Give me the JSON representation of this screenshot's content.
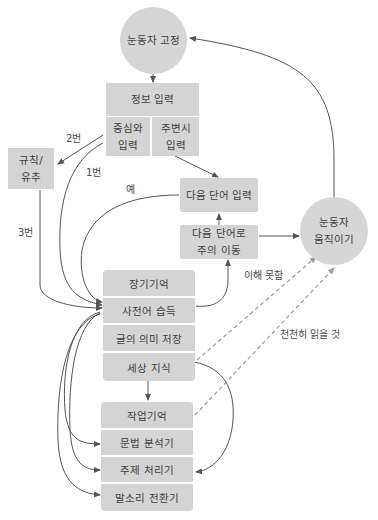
{
  "diagram": {
    "type": "reading-process-flowchart",
    "nodes": {
      "fixation": {
        "label": "눈동자 고정",
        "shape": "circle"
      },
      "info_input": {
        "label": "정보 입력",
        "sub": {
          "foveal": "중심와\n입력",
          "foveal_l1": "중심와",
          "foveal_l2": "입력",
          "peripheral_l1": "주변시",
          "peripheral_l2": "입력"
        }
      },
      "rule_inference": {
        "l1": "규칙/",
        "l2": "유추"
      },
      "next_word_input": {
        "label": "다음 단어 입력"
      },
      "shift_attention": {
        "l1": "다음 단어로",
        "l2": "주의 이동"
      },
      "eye_movement": {
        "l1": "눈동자",
        "l2": "움직이기",
        "shape": "circle"
      },
      "long_term_memory": {
        "rows": [
          "장기기억",
          "사전어 습득",
          "글의 의미 저장",
          "세상 지식"
        ]
      },
      "working_memory": {
        "rows": [
          "작업기억",
          "문법 분석기",
          "주제 처리기",
          "말소리 전환기"
        ]
      }
    },
    "edge_labels": {
      "path2": "2번",
      "path1": "1번",
      "path3": "3번",
      "yes": "예",
      "not_understood": "이해 못함",
      "read_slowly": "천천히 읽을 것"
    },
    "colors": {
      "node_fill": "#d4d4d4",
      "circle_fill": "#d6d6d6",
      "edge": "#555555",
      "dashed_edge": "#9a9a9a",
      "background": "#ffffff"
    }
  }
}
